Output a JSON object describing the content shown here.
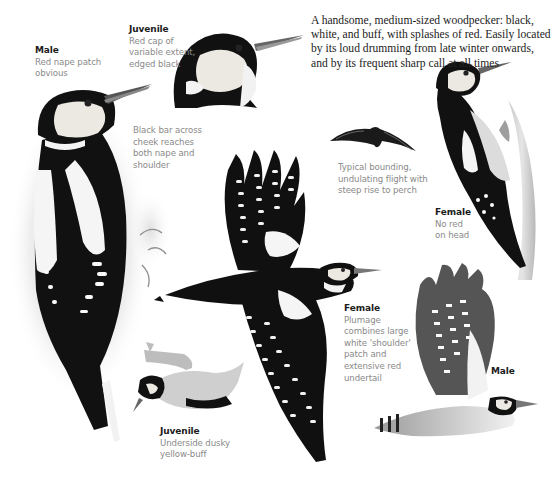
{
  "intro": {
    "lines": [
      "A handsome, medium-sized woodpecker: black,",
      "white, and buff, with splashes of red. Easily located",
      "by its loud drumming from late winter onwards,",
      "and by its frequent sharp call at all times"
    ]
  },
  "captions": {
    "male_perched": {
      "title": "Male",
      "lines": [
        "Red nape patch",
        "obvious"
      ]
    },
    "juvenile_head": {
      "title": "Juvenile",
      "lines": [
        "Red cap of",
        "variable extent,",
        "edged black"
      ]
    },
    "cheek_bar": {
      "lines": [
        "Black bar across",
        "cheek reaches",
        "both nape and",
        "shoulder"
      ]
    },
    "flight": {
      "lines": [
        "Typical bounding,",
        "undulating flight with",
        "steep rise to perch"
      ]
    },
    "female_perched": {
      "title": "Female",
      "lines": [
        "No red",
        "on head"
      ]
    },
    "female_flying": {
      "title": "Female",
      "lines": [
        "Plumage",
        "combines large",
        "white 'shoulder'",
        "patch and",
        "extensive red",
        "undertail"
      ]
    },
    "male_flying": {
      "title": "Male"
    },
    "juvenile_hanging": {
      "title": "Juvenile",
      "lines": [
        "Underside dusky",
        "yellow-buff"
      ]
    }
  },
  "illustrations": [
    {
      "name": "male-perched",
      "subject": "Great spotted woodpecker male, perched side view"
    },
    {
      "name": "juvenile-head",
      "subject": "Juvenile head close-up"
    },
    {
      "name": "flight-silhouette",
      "subject": "Bird in bounding flight, distant"
    },
    {
      "name": "female-perched",
      "subject": "Female clinging to tree trunk"
    },
    {
      "name": "female-flying",
      "subject": "Female with wings spread, from above"
    },
    {
      "name": "male-flying",
      "subject": "Male in flight, from below"
    },
    {
      "name": "juvenile-hanging",
      "subject": "Juvenile hanging under a branch"
    }
  ],
  "colors": {
    "ink": "#111111",
    "caption_title": "#1c1c1c",
    "caption_text": "#8a8a8a",
    "body_text": "#222222",
    "buff": "#e8e4da",
    "wash": "#cfcfcf"
  }
}
